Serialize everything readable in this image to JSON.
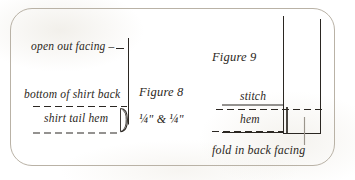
{
  "page": {
    "kind": "sewing-instruction-diagram",
    "border_color": "#b9b2a6",
    "ink_color": "#2b2722",
    "background": "#fefefe"
  },
  "figure8": {
    "caption": "Figure 8",
    "measurement": {
      "first": "1/4\"",
      "conjunction": "&",
      "second": "1/4\"",
      "display": "¼\" & ¼\""
    },
    "labels": {
      "open_out_facing": "open out facing –",
      "bottom_of_shirt_back": "bottom of shirt back",
      "shirt_tail_hem": "shirt tail hem"
    }
  },
  "figure9": {
    "caption": "Figure 9",
    "labels": {
      "stitch": "stitch",
      "hem": "hem",
      "fold_in_back_facing": "fold in back facing"
    }
  }
}
